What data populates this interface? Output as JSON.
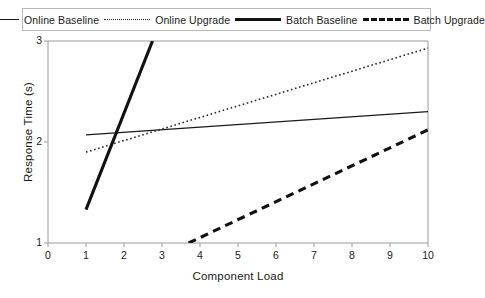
{
  "chart_data": {
    "type": "line",
    "title": "",
    "xlabel": "Component Load",
    "ylabel": "Response Time (s)",
    "xlim": [
      0,
      10
    ],
    "ylim": [
      1,
      3
    ],
    "xticks": [
      "0",
      "1",
      "2",
      "3",
      "4",
      "5",
      "6",
      "7",
      "8",
      "9",
      "10"
    ],
    "yticks": [
      "1",
      "2",
      "3"
    ],
    "grid": false,
    "legend_position": "top",
    "series": [
      {
        "name": "Online Baseline",
        "style": "solid-thin",
        "color": "#1a1a1a",
        "x": [
          1,
          10
        ],
        "y": [
          2.07,
          2.3
        ]
      },
      {
        "name": "Online Upgrade",
        "style": "dotted",
        "color": "#2b2b2b",
        "x": [
          1,
          10
        ],
        "y": [
          1.9,
          2.93
        ]
      },
      {
        "name": "Batch Baseline",
        "style": "solid-thick",
        "color": "#111111",
        "x": [
          1,
          2.75
        ],
        "y": [
          1.33,
          3.0
        ]
      },
      {
        "name": "Batch Upgrade",
        "style": "dashed-thick",
        "color": "#111111",
        "x": [
          3.7,
          10
        ],
        "y": [
          1.0,
          2.12
        ]
      }
    ]
  },
  "legend": {
    "items": [
      {
        "label": "Online Baseline"
      },
      {
        "label": "Online Upgrade"
      },
      {
        "label": "Batch Baseline"
      },
      {
        "label": "Batch Upgrade"
      }
    ]
  },
  "axes": {
    "x_title": "Component Load",
    "y_title": "Response Time (s)",
    "x_ticks": [
      {
        "label": "0"
      },
      {
        "label": "1"
      },
      {
        "label": "2"
      },
      {
        "label": "3"
      },
      {
        "label": "4"
      },
      {
        "label": "5"
      },
      {
        "label": "6"
      },
      {
        "label": "7"
      },
      {
        "label": "8"
      },
      {
        "label": "9"
      },
      {
        "label": "10"
      }
    ],
    "y_ticks": [
      {
        "label": "3"
      },
      {
        "label": "2"
      },
      {
        "label": "1"
      }
    ]
  },
  "colors": {
    "axis": "#9a9a9a",
    "ink": "#1a1a1a",
    "background": "#ffffff"
  }
}
